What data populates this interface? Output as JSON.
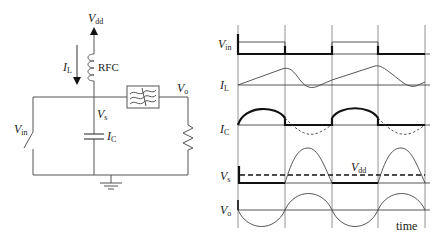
{
  "circuit": {
    "supply_label": {
      "main": "V",
      "sub": "dd"
    },
    "inductor_label": "RFC",
    "inductor_current": {
      "main": "I",
      "sub": "L"
    },
    "switch_node": {
      "main": "V",
      "sub": "s"
    },
    "input": {
      "main": "V",
      "sub": "in"
    },
    "cap_current": {
      "main": "I",
      "sub": "C"
    },
    "output": {
      "main": "V",
      "sub": "o"
    },
    "components": [
      "dc-supply",
      "rf-choke",
      "switch",
      "shunt-capacitor",
      "bandpass-filter",
      "load-resistor",
      "ground"
    ]
  },
  "waveforms": {
    "traces": [
      {
        "id": "vin",
        "main": "V",
        "sub": "in"
      },
      {
        "id": "il",
        "main": "I",
        "sub": "L"
      },
      {
        "id": "ic",
        "main": "I",
        "sub": "C"
      },
      {
        "id": "vs",
        "main": "V",
        "sub": "s"
      },
      {
        "id": "vo",
        "main": "V",
        "sub": "o"
      }
    ],
    "vdd_label": {
      "main": "V",
      "sub": "dd"
    },
    "time_label": "time"
  },
  "colors": {
    "ink": "#111111",
    "wire": "#555555",
    "background": "#ffffff"
  }
}
